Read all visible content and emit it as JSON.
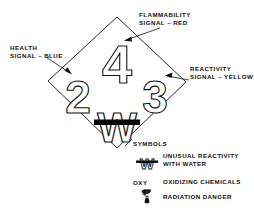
{
  "diagram": {
    "diamond": {
      "quadrants": [
        {
          "position": "top",
          "name": "flammability",
          "rating": "4",
          "color_name": "RED"
        },
        {
          "position": "left",
          "name": "health",
          "rating": "2",
          "color_name": "BLUE"
        },
        {
          "position": "right",
          "name": "reactivity",
          "rating": "3",
          "color_name": "YELLOW"
        },
        {
          "position": "bottom",
          "name": "special",
          "rating": "W",
          "color_name": "WHITE"
        }
      ]
    },
    "callouts": {
      "flammability": {
        "line1": "FLAMMABILITY",
        "line2": "SIGNAL – RED"
      },
      "health": {
        "line1": "HEALTH",
        "line2": "SIGNAL – BLUE"
      },
      "reactivity": {
        "line1": "REACTIVITY",
        "line2": "SIGNAL – YELLOW"
      }
    },
    "legend": {
      "heading": "SYMBOLS",
      "items": [
        {
          "symbol": "w-strikethrough",
          "code": "",
          "line1": "UNUSUAL REACTIVITY",
          "line2": "WITH WATER"
        },
        {
          "symbol": "oxy-text",
          "code": "OXY",
          "line1": "OXIDIZING CHEMICALS",
          "line2": ""
        },
        {
          "symbol": "radiation",
          "code": "",
          "line1": "RADIATION DANGER",
          "line2": ""
        }
      ]
    },
    "colors": {
      "stroke": "#111111",
      "background": "#ffffff",
      "bar": "#000000"
    }
  }
}
